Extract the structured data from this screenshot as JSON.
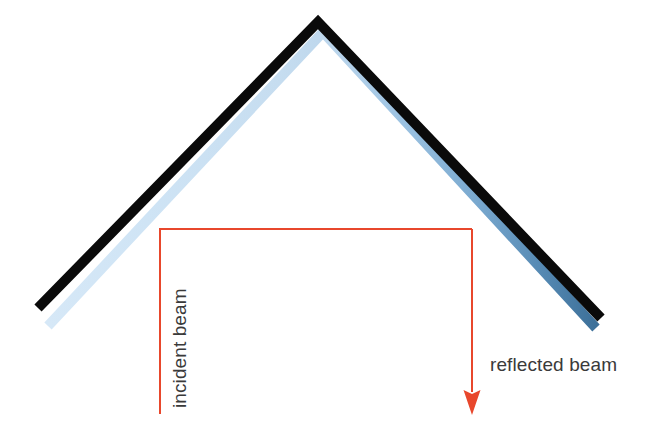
{
  "diagram": {
    "background_color": "#ffffff",
    "labels": {
      "incident_beam": "incident beam",
      "reflected_beam": "reflected beam"
    },
    "colors": {
      "mirror_stroke": "#0a0a0a",
      "beam_gradient_start": "#cfe4f5",
      "beam_gradient_mid": "#9dc3e2",
      "beam_gradient_end": "#3d7099",
      "ray_red": "#e8472c",
      "label_text": "#3a3a3a"
    },
    "geometry": {
      "apex": {
        "x": 318,
        "y": 22
      },
      "mirror_left_end": {
        "x": 38,
        "y": 308
      },
      "mirror_right_end": {
        "x": 601,
        "y": 318
      },
      "mirror_stroke_width": 10,
      "beam_band_stroke_width": 10,
      "beam_band_offset": {
        "x": 5,
        "y": 9
      },
      "incident_ray_start": {
        "x": 160,
        "y": 414
      },
      "incident_ray_corner": {
        "x": 160,
        "y": 229
      },
      "reflected_ray_corner": {
        "x": 472,
        "y": 229
      },
      "reflected_ray_tip": {
        "x": 472,
        "y": 414
      },
      "ray_stroke_width": 2,
      "arrowhead_width": 17,
      "arrowhead_height": 24
    },
    "text_placement": {
      "incident_beam": {
        "x": 186,
        "y": 408,
        "rotation_deg": -90,
        "font_size": 19
      },
      "reflected_beam": {
        "x": 490,
        "y": 371,
        "rotation_deg": 0,
        "font_size": 19
      }
    }
  }
}
